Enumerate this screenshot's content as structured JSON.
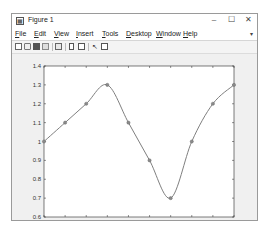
{
  "window": {
    "title": "Figure 1",
    "controls": {
      "minimize": "–",
      "maximize": "☐",
      "close": "✕"
    }
  },
  "menubar": {
    "items": [
      {
        "label": "File",
        "accel": "F",
        "rest": "ile"
      },
      {
        "label": "Edit",
        "accel": "E",
        "rest": "dit"
      },
      {
        "label": "View",
        "accel": "V",
        "rest": "iew"
      },
      {
        "label": "Insert",
        "accel": "I",
        "rest": "nsert"
      },
      {
        "label": "Tools",
        "accel": "T",
        "rest": "ools"
      },
      {
        "label": "Desktop",
        "accel": "D",
        "rest": "esktop"
      },
      {
        "label": "Window",
        "accel": "W",
        "rest": "indow"
      },
      {
        "label": "Help",
        "accel": "H",
        "rest": "elp"
      }
    ],
    "overflow": "▾"
  },
  "toolbar": {
    "icons": [
      "new-figure-icon",
      "open-file-icon",
      "save-icon",
      "print-icon",
      "print-preview-icon",
      "link-plot-icon",
      "insert-colorbar-icon",
      "edit-plot-pointer-icon",
      "property-inspector-icon"
    ]
  },
  "chart_data": {
    "type": "line",
    "title": "",
    "xlabel": "",
    "ylabel": "",
    "x": [
      0.1,
      0.2,
      0.3,
      0.4,
      0.5,
      0.6,
      0.7,
      0.8,
      0.9,
      1.0
    ],
    "series": [
      {
        "name": "data",
        "values": [
          1.0,
          1.1,
          1.2,
          1.3,
          1.1,
          0.9,
          0.7,
          1.0,
          1.2,
          1.3
        ],
        "marker": "o",
        "line": "spline",
        "color": "#7f7f7f"
      }
    ],
    "xlim": [
      0.1,
      1.0
    ],
    "ylim": [
      0.6,
      1.4
    ],
    "xticks": [
      "0.1",
      "0.2",
      "0.3",
      "0.4",
      "0.5",
      "0.6",
      "0.7",
      "0.8",
      "0.9",
      "1"
    ],
    "yticks": [
      "0.6",
      "0.7",
      "0.8",
      "0.9",
      "1",
      "1.1",
      "1.2",
      "1.3",
      "1.4"
    ],
    "grid": false,
    "legend": "none"
  }
}
